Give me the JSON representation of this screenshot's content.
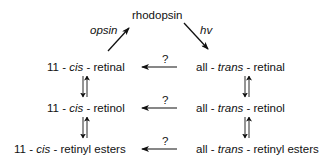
{
  "diagram": {
    "top_node": "rhodopsin",
    "edges_top": {
      "left_label": "opsin",
      "right_label": "hv"
    },
    "left_column": [
      {
        "prefix": "11 - ",
        "italic": "cis",
        "suffix": " - retinal"
      },
      {
        "prefix": "11 - ",
        "italic": "cis",
        "suffix": " - retinol"
      },
      {
        "prefix": "11 - ",
        "italic": "cis",
        "suffix": " - retinyl esters"
      }
    ],
    "right_column": [
      {
        "prefix": "all - ",
        "italic": "trans",
        "suffix": " - retinal"
      },
      {
        "prefix": "all - ",
        "italic": "trans",
        "suffix": " - retinol"
      },
      {
        "prefix": "all - ",
        "italic": "trans",
        "suffix": " - retinyl esters"
      }
    ],
    "horizontal_arrow_label": "?",
    "horizontal_arrows": [
      {
        "from": "all-trans-retinal",
        "to": "11-cis-retinal",
        "label": "?"
      },
      {
        "from": "all-trans-retinol",
        "to": "11-cis-retinol",
        "label": "?"
      },
      {
        "from": "all-trans-retinyl esters",
        "to": "11-cis-retinyl esters",
        "label": "?"
      }
    ]
  }
}
